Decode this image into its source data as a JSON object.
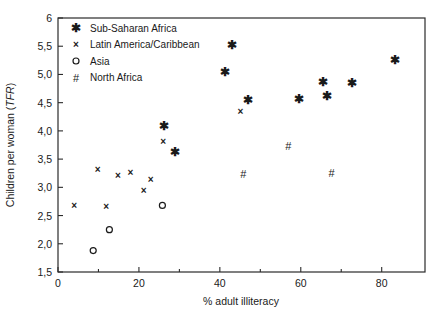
{
  "chart_data": {
    "type": "scatter",
    "title": "",
    "xlabel": "% adult illiteracy",
    "ylabel": "Children per woman (TFR)",
    "ylabel_plain": "Children per woman (",
    "ylabel_italic": "TFR",
    "ylabel_tail": ")",
    "xlim": [
      0,
      90.7
    ],
    "ylim": [
      1.5,
      6
    ],
    "grid": false,
    "legend_position": "top-left",
    "xticks": [
      0,
      20,
      40,
      60,
      80
    ],
    "xtick_labels": [
      "0",
      "20",
      "40",
      "60",
      "80"
    ],
    "xticks_minor": [
      10,
      30,
      50,
      70
    ],
    "yticks": [
      1.5,
      2.0,
      2.5,
      3.0,
      3.5,
      4.0,
      4.5,
      5.0,
      5.5,
      6
    ],
    "ytick_labels": [
      "1,5",
      "2,0",
      "2,5",
      "3,0",
      "3,5",
      "4,0",
      "4,5",
      "5,0",
      "5,5",
      "6"
    ],
    "series": [
      {
        "name": "Sub-Saharan Africa",
        "marker": "star",
        "glyph": "✱",
        "points": [
          {
            "x": 26.3,
            "y": 4.09
          },
          {
            "x": 29.0,
            "y": 3.63
          },
          {
            "x": 41.2,
            "y": 5.05
          },
          {
            "x": 42.9,
            "y": 5.52
          },
          {
            "x": 47.0,
            "y": 4.54
          },
          {
            "x": 59.6,
            "y": 4.56
          },
          {
            "x": 65.4,
            "y": 4.87
          },
          {
            "x": 66.5,
            "y": 4.62
          },
          {
            "x": 72.6,
            "y": 4.85
          },
          {
            "x": 83.4,
            "y": 5.25
          }
        ]
      },
      {
        "name": "Latin America/Caribbean",
        "marker": "x",
        "glyph": "×",
        "points": [
          {
            "x": 4.0,
            "y": 2.68
          },
          {
            "x": 9.8,
            "y": 3.32
          },
          {
            "x": 11.9,
            "y": 2.66
          },
          {
            "x": 14.8,
            "y": 3.21
          },
          {
            "x": 17.9,
            "y": 3.26
          },
          {
            "x": 21.2,
            "y": 2.95
          },
          {
            "x": 22.9,
            "y": 3.14
          },
          {
            "x": 26.0,
            "y": 3.82
          },
          {
            "x": 45.1,
            "y": 4.35
          }
        ]
      },
      {
        "name": "Asia",
        "marker": "circle",
        "glyph": "○",
        "points": [
          {
            "x": 8.7,
            "y": 1.88
          },
          {
            "x": 12.7,
            "y": 2.25
          },
          {
            "x": 25.8,
            "y": 2.68
          }
        ]
      },
      {
        "name": "North Africa",
        "marker": "hash",
        "glyph": "#",
        "points": [
          {
            "x": 45.8,
            "y": 3.23
          },
          {
            "x": 56.9,
            "y": 3.73
          },
          {
            "x": 67.6,
            "y": 3.26
          }
        ]
      }
    ]
  }
}
